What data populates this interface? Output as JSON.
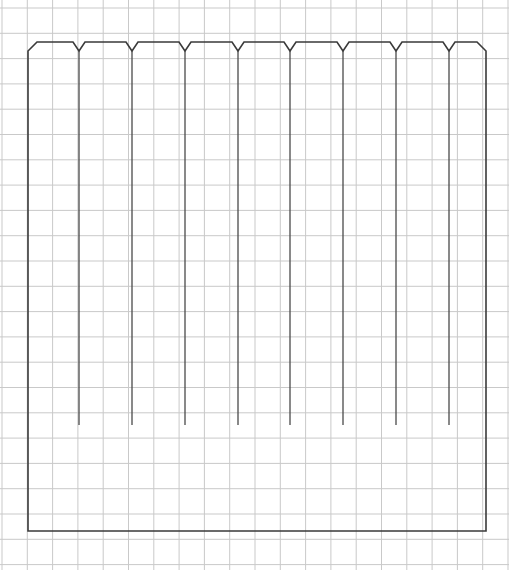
{
  "canvas": {
    "width": 509,
    "height": 570,
    "background_color": "#ffffff",
    "title": "Graph paper technical sketch"
  },
  "grid": {
    "name": "graph-paper-grid",
    "line_color": "#c9c9c9",
    "line_width": 1,
    "cell_size_px": 25.3,
    "x_origin": 2,
    "y_origin": 8,
    "columns": 21,
    "rows": 23,
    "visible": true
  },
  "figure": {
    "name": "comb-profile-outline",
    "stroke_color": "#3a3a3a",
    "stroke_width": 1.6,
    "fill": "none",
    "bounds": {
      "left": 28,
      "right": 486,
      "top": 42,
      "bottom": 531
    },
    "corner_chamfer_px": 9,
    "notch": {
      "name": "v-notch",
      "count": 8,
      "half_width_px": 6,
      "depth_px": 9,
      "top_y": 42,
      "apex_y": 51,
      "center_x_values": [
        79,
        132,
        185,
        238,
        290,
        343,
        396,
        449
      ]
    },
    "tine_slots": {
      "name": "tine-slot-lines",
      "count": 8,
      "description": "Vertical lines descending from each notch apex into the body of the shape",
      "stroke_color": "#4a4a4a",
      "stroke_width": 1.3,
      "start_y": 51,
      "end_y": 425,
      "x_values": [
        79,
        132,
        185,
        238,
        290,
        343,
        396,
        449
      ]
    }
  },
  "legend": {
    "labels": []
  }
}
